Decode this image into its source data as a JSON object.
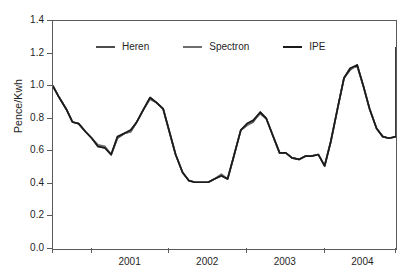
{
  "chart_data": {
    "type": "line",
    "title": "",
    "xlabel": "",
    "ylabel": "Pence/Kwh",
    "ylim": [
      0.0,
      1.4
    ],
    "ytick_labels": [
      "0.0",
      "0.2",
      "0.4",
      "0.6",
      "0.8",
      "1.0",
      "1.2",
      "1.4"
    ],
    "ytick_values": [
      0.0,
      0.2,
      0.4,
      0.6,
      0.8,
      1.0,
      1.2,
      1.4
    ],
    "xtick_labels": [
      "2001",
      "2002",
      "2003",
      "2004"
    ],
    "xlim": [
      2000.5,
      2004.92
    ],
    "xtick_boundaries": [
      2001.0,
      2002.0,
      2003.0,
      2004.0
    ],
    "grid": false,
    "legend_position": "top-center",
    "legend": [
      "Heren",
      "Spectron",
      "IPE"
    ],
    "colors": {
      "Heren": "#4d4d4d",
      "Spectron": "#6e6e6e",
      "IPE": "#1a1a1a"
    },
    "x": [
      2000.5,
      2000.58,
      2000.67,
      2000.75,
      2000.83,
      2000.92,
      2001.0,
      2001.08,
      2001.17,
      2001.25,
      2001.33,
      2001.42,
      2001.5,
      2001.58,
      2001.67,
      2001.75,
      2001.83,
      2001.92,
      2002.0,
      2002.08,
      2002.17,
      2002.25,
      2002.33,
      2002.42,
      2002.5,
      2002.58,
      2002.67,
      2002.75,
      2002.83,
      2002.92,
      2003.0,
      2003.08,
      2003.17,
      2003.25,
      2003.33,
      2003.42,
      2003.5,
      2003.58,
      2003.67,
      2003.75,
      2003.83,
      2003.92,
      2004.0,
      2004.08,
      2004.17,
      2004.25,
      2004.33,
      2004.42,
      2004.5,
      2004.58,
      2004.67,
      2004.75,
      2004.83,
      2004.92
    ],
    "series": [
      {
        "name": "Heren",
        "values": [
          1.0,
          0.93,
          0.86,
          0.78,
          0.77,
          0.72,
          0.68,
          0.63,
          0.62,
          0.58,
          0.68,
          0.71,
          0.72,
          0.78,
          0.86,
          0.93,
          0.9,
          0.86,
          0.72,
          0.58,
          0.47,
          0.42,
          0.41,
          0.41,
          0.41,
          0.43,
          0.45,
          0.43,
          0.57,
          0.73,
          0.76,
          0.78,
          0.84,
          0.8,
          0.7,
          0.59,
          0.59,
          0.56,
          0.55,
          0.57,
          0.57,
          0.58,
          0.51,
          0.66,
          0.87,
          1.05,
          1.1,
          1.13,
          1.0,
          0.86,
          0.74,
          0.69,
          0.68,
          0.69
        ]
      },
      {
        "name": "Spectron",
        "values": [
          1.0,
          0.93,
          0.86,
          0.78,
          0.77,
          0.72,
          0.68,
          0.64,
          0.63,
          0.58,
          0.68,
          0.71,
          0.72,
          0.78,
          0.86,
          0.92,
          0.9,
          0.86,
          0.72,
          0.58,
          0.47,
          0.42,
          0.41,
          0.41,
          0.41,
          0.43,
          0.46,
          0.43,
          0.57,
          0.73,
          0.76,
          0.79,
          0.83,
          0.8,
          0.7,
          0.59,
          0.59,
          0.56,
          0.55,
          0.57,
          0.57,
          0.58,
          0.51,
          0.66,
          0.87,
          1.05,
          1.11,
          1.12,
          1.0,
          0.86,
          0.74,
          0.69,
          0.68,
          0.69
        ]
      },
      {
        "name": "IPE",
        "values": [
          1.0,
          0.93,
          0.86,
          0.78,
          0.77,
          0.72,
          0.68,
          0.63,
          0.62,
          0.58,
          0.69,
          0.71,
          0.73,
          0.78,
          0.86,
          0.93,
          0.9,
          0.86,
          0.72,
          0.58,
          0.47,
          0.42,
          0.41,
          0.41,
          0.41,
          0.43,
          0.45,
          0.43,
          0.57,
          0.73,
          0.77,
          0.79,
          0.84,
          0.8,
          0.7,
          0.59,
          0.59,
          0.56,
          0.55,
          0.57,
          0.57,
          0.58,
          0.51,
          0.66,
          0.87,
          1.05,
          1.11,
          1.13,
          1.0,
          0.86,
          0.74,
          0.69,
          0.68,
          0.69
        ]
      }
    ],
    "tail": {
      "x": [
        2004.92,
        2005.0,
        2005.08,
        2005.17,
        2005.25,
        2005.33
      ],
      "values": [
        0.69,
        0.72,
        0.75,
        0.76,
        1.1,
        1.24
      ]
    }
  }
}
